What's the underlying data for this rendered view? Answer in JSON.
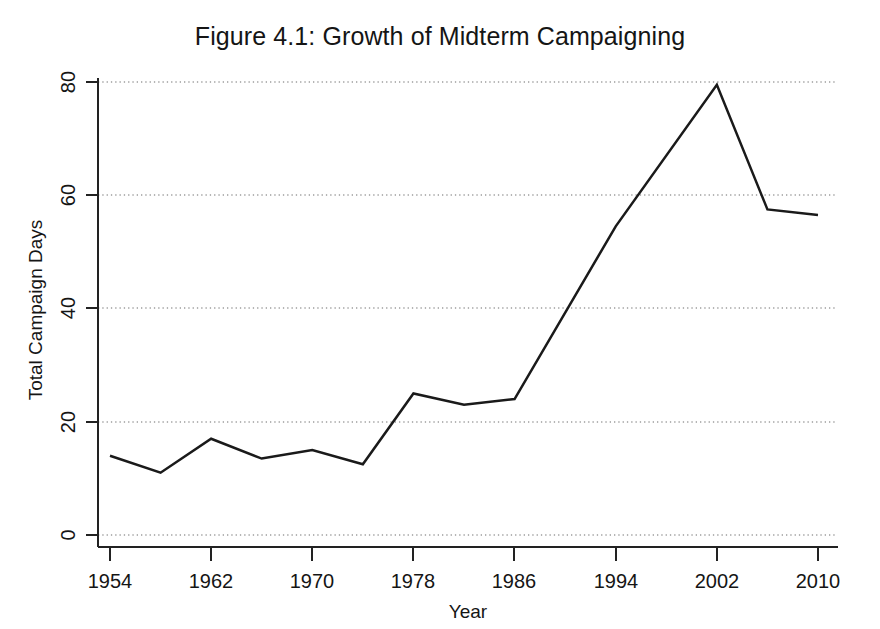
{
  "chart_data": {
    "type": "line",
    "title": "Figure 4.1: Growth of Midterm Campaigning",
    "xlabel": "Year",
    "ylabel": "Total Campaign Days",
    "xlim": [
      1953,
      2011
    ],
    "ylim": [
      0,
      82
    ],
    "xticks": [
      1954,
      1962,
      1970,
      1978,
      1986,
      1994,
      2002,
      2010
    ],
    "xtick_labels": [
      "1954",
      "1962",
      "1970",
      "1978",
      "1986",
      "1994",
      "2002",
      "2010"
    ],
    "yticks": [
      0,
      20,
      40,
      60,
      80
    ],
    "ytick_labels": [
      "0",
      "20",
      "40",
      "60",
      "80"
    ],
    "grid": "horizontal-dotted",
    "legend": null,
    "series": [
      {
        "name": "Total Campaign Days",
        "color": "#1a1a1a",
        "x": [
          1954,
          1958,
          1962,
          1966,
          1970,
          1974,
          1978,
          1982,
          1986,
          1994,
          2002,
          2006,
          2010
        ],
        "values": [
          14,
          11,
          17,
          13.5,
          15,
          12.5,
          25,
          23,
          24,
          54.5,
          79.5,
          57.5,
          56.5
        ]
      }
    ]
  },
  "axis": {
    "y_label": "Total Campaign Days",
    "x_label": "Year"
  }
}
